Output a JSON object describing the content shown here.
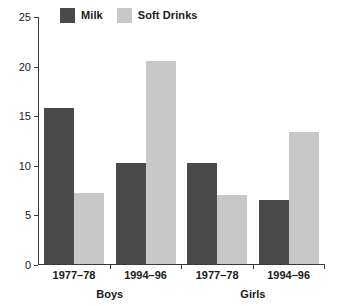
{
  "chart_data": {
    "type": "bar",
    "title": "",
    "xlabel": "",
    "ylabel": "",
    "ylim": [
      0,
      25
    ],
    "yticks": [
      0,
      5,
      10,
      15,
      20,
      25
    ],
    "ytick_labels": [
      "0",
      "5",
      "10",
      "15",
      "20",
      "25"
    ],
    "grid": false,
    "legend_position": "top-left",
    "categories": [
      "1977–78",
      "1994–96",
      "1977–78",
      "1994–96"
    ],
    "group_labels": [
      "Boys",
      "Girls"
    ],
    "series": [
      {
        "name": "Milk",
        "color": "#4a4a4a",
        "values": [
          15.7,
          10.2,
          10.2,
          6.45
        ]
      },
      {
        "name": "Soft Drinks",
        "color": "#c8c8c8",
        "values": [
          7.2,
          20.5,
          7.0,
          13.3
        ]
      }
    ],
    "bars": [
      {
        "group": "Boys",
        "period": "1977–78",
        "series": "Milk",
        "value": 15.7
      },
      {
        "group": "Boys",
        "period": "1977–78",
        "series": "Soft Drinks",
        "value": 7.2
      },
      {
        "group": "Boys",
        "period": "1994–96",
        "series": "Milk",
        "value": 10.2
      },
      {
        "group": "Boys",
        "period": "1994–96",
        "series": "Soft Drinks",
        "value": 20.5
      },
      {
        "group": "Girls",
        "period": "1977–78",
        "series": "Milk",
        "value": 10.2
      },
      {
        "group": "Girls",
        "period": "1977–78",
        "series": "Soft Drinks",
        "value": 7.0
      },
      {
        "group": "Girls",
        "period": "1994–96",
        "series": "Milk",
        "value": 6.45
      },
      {
        "group": "Girls",
        "period": "1994–96",
        "series": "Soft Drinks",
        "value": 13.3
      }
    ]
  },
  "legend": {
    "entries": [
      {
        "label": "Milk",
        "color": "#4a4a4a",
        "swatch_name": "legend-swatch-milk"
      },
      {
        "label": "Soft Drinks",
        "color": "#c8c8c8",
        "swatch_name": "legend-swatch-soft-drinks"
      }
    ]
  },
  "axes": {
    "y": {
      "ticks": [
        "0",
        "5",
        "10",
        "15",
        "20",
        "25"
      ],
      "min": 0,
      "max": 25
    },
    "x": {
      "period_labels": [
        "1977–78",
        "1994–96",
        "1977–78",
        "1994–96"
      ],
      "group_labels": [
        "Boys",
        "Girls"
      ]
    }
  }
}
